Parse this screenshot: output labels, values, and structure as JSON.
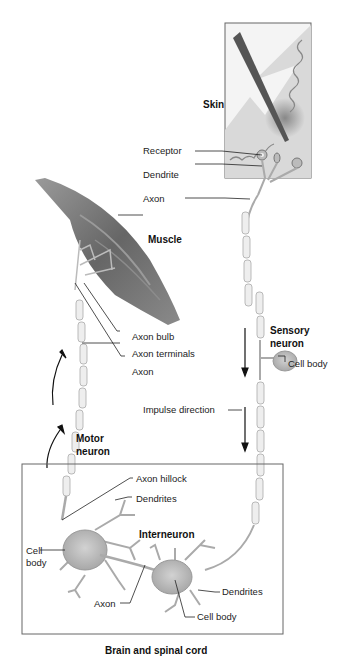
{
  "diagram": {
    "type": "reflex-arc-neuron-diagram",
    "regions": {
      "skin": "Skin",
      "muscle": "Muscle",
      "cns": "Brain and spinal cord"
    },
    "neurons": {
      "sensory": "Sensory\nneuron",
      "sensory_line1": "Sensory",
      "sensory_line2": "neuron",
      "motor_line1": "Motor",
      "motor_line2": "neuron",
      "interneuron": "Interneuron"
    },
    "labels": {
      "receptor": "Receptor",
      "dendrite": "Dendrite",
      "axon_sensory": "Axon",
      "axon_bulb": "Axon bulb",
      "axon_terminals": "Axon terminals",
      "axon_motor": "Axon",
      "cell_body_sensory": "Cell body",
      "impulse_direction": "Impulse direction",
      "axon_hillock": "Axon hillock",
      "dendrites_motor": "Dendrites",
      "cell_body_motor_line1": "Cell",
      "cell_body_motor_line2": "body",
      "axon_interneuron": "Axon",
      "dendrites_interneuron": "Dendrites",
      "cell_body_interneuron": "Cell body"
    },
    "colors": {
      "tissue": "#a9a9a9",
      "muscle": "#6e6e6e",
      "myelin": "#eeeeee",
      "outline": "#555555"
    }
  }
}
